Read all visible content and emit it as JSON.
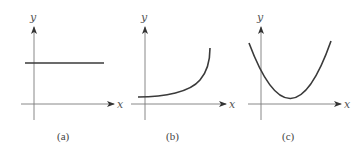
{
  "figure": {
    "panels": [
      {
        "id": "a",
        "caption": "(a)",
        "x_label": "x",
        "y_label": "y",
        "curve_type": "constant",
        "description": "horizontal line above x-axis"
      },
      {
        "id": "b",
        "caption": "(b)",
        "x_label": "x",
        "y_label": "y",
        "curve_type": "exponential-growth",
        "description": "curve starting slightly above x-axis, increasing at an increasing rate"
      },
      {
        "id": "c",
        "caption": "(c)",
        "x_label": "x",
        "y_label": "y",
        "curve_type": "parabola",
        "description": "upward-opening parabola with minimum near x-axis to the right of y-axis"
      }
    ],
    "colors": {
      "axis": "#7a7a7a",
      "curve": "#3a3a3a",
      "text": "#444444"
    }
  }
}
